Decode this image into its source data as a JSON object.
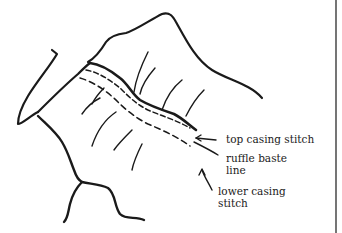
{
  "diagram": {
    "labels": {
      "top_casing_stitch": "top casing stitch",
      "ruffle_baste_line_1": "ruffle baste",
      "ruffle_baste_line_2": "line",
      "lower_casing_stitch_1": "lower casing",
      "lower_casing_stitch_2": "stitch"
    },
    "colors": {
      "ink": "#1a1a1a",
      "background": "#ffffff"
    }
  }
}
